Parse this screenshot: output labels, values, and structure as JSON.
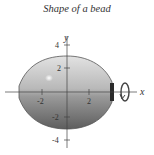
{
  "title": "Shape of a bead",
  "axes": {
    "x_label": "x",
    "y_label": "y",
    "x_ticks": [
      {
        "value": -2,
        "label": "-2"
      },
      {
        "value": 2,
        "label": "2"
      }
    ],
    "y_ticks": [
      {
        "value": 4,
        "label": "4"
      },
      {
        "value": 2,
        "label": "2"
      },
      {
        "value": -2,
        "label": "-2"
      },
      {
        "value": -4,
        "label": "-4"
      }
    ]
  },
  "shape": {
    "name": "bead",
    "description": "Solid of revolution about the x-axis",
    "fill_top": "#d4d4d4",
    "fill_bottom": "#6e6e6e",
    "outline": "#555555"
  },
  "annotation": {
    "rotation_arrow": "rotation about x-axis"
  }
}
